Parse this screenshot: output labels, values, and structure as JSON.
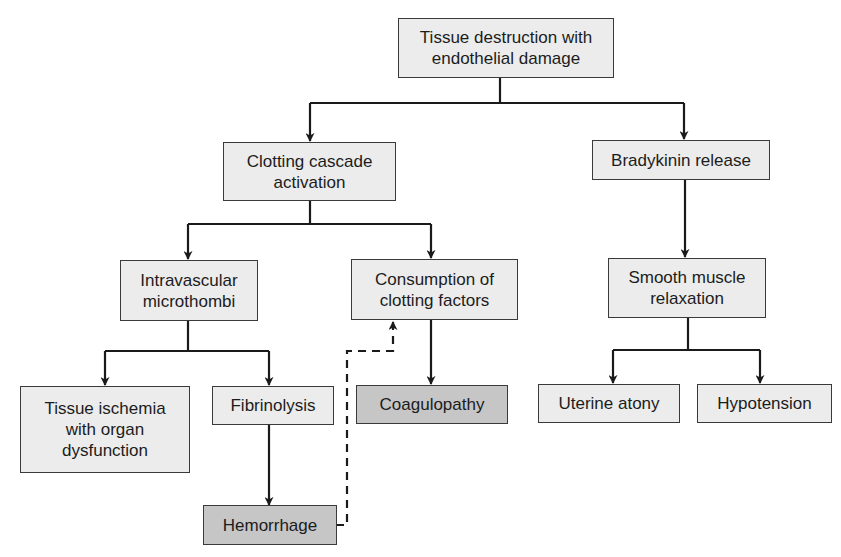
{
  "diagram": {
    "nodes": {
      "root": {
        "label": "Tissue destruction with endothelial damage",
        "line1": "Tissue destruction with",
        "line2": "endothelial damage",
        "fill": "#ececec"
      },
      "clotting": {
        "label": "Clotting cascade activation",
        "line1": "Clotting cascade",
        "line2": "activation",
        "fill": "#ececec"
      },
      "bradykinin": {
        "label": "Bradykinin release",
        "fill": "#ececec"
      },
      "microthrombi": {
        "label": "Intravascular microthombi",
        "line1": "Intravascular",
        "line2": "microthombi",
        "fill": "#ececec"
      },
      "consumption": {
        "label": "Consumption of clotting factors",
        "line1": "Consumption of",
        "line2": "clotting factors",
        "fill": "#ececec"
      },
      "smooth_muscle": {
        "label": "Smooth muscle relaxation",
        "line1": "Smooth muscle",
        "line2": "relaxation",
        "fill": "#ececec"
      },
      "ischemia": {
        "label": "Tissue ischemia with organ dysfunction",
        "line1": "Tissue ischemia",
        "line2": "with organ",
        "line3": "dysfunction",
        "fill": "#ececec"
      },
      "fibrinolysis": {
        "label": "Fibrinolysis",
        "fill": "#ececec"
      },
      "coagulopathy": {
        "label": "Coagulopathy",
        "fill": "#c6c6c6"
      },
      "uterine_atony": {
        "label": "Uterine atony",
        "fill": "#ececec"
      },
      "hypotension": {
        "label": "Hypotension",
        "fill": "#ececec"
      },
      "hemorrhage": {
        "label": "Hemorrhage",
        "fill": "#c6c6c6"
      }
    },
    "edges": [
      {
        "from": "root",
        "to": "clotting",
        "style": "solid"
      },
      {
        "from": "root",
        "to": "bradykinin",
        "style": "solid"
      },
      {
        "from": "clotting",
        "to": "microthrombi",
        "style": "solid"
      },
      {
        "from": "clotting",
        "to": "consumption",
        "style": "solid"
      },
      {
        "from": "bradykinin",
        "to": "smooth_muscle",
        "style": "solid"
      },
      {
        "from": "microthrombi",
        "to": "ischemia",
        "style": "solid"
      },
      {
        "from": "microthrombi",
        "to": "fibrinolysis",
        "style": "solid"
      },
      {
        "from": "consumption",
        "to": "coagulopathy",
        "style": "solid"
      },
      {
        "from": "smooth_muscle",
        "to": "uterine_atony",
        "style": "solid"
      },
      {
        "from": "smooth_muscle",
        "to": "hypotension",
        "style": "solid"
      },
      {
        "from": "fibrinolysis",
        "to": "hemorrhage",
        "style": "solid"
      },
      {
        "from": "hemorrhage",
        "to": "consumption",
        "style": "dashed"
      }
    ]
  }
}
